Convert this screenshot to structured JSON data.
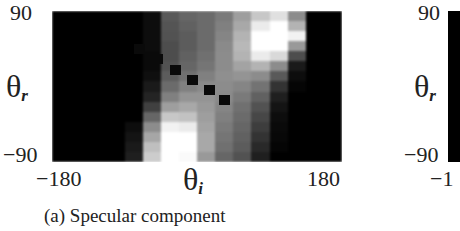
{
  "figure": {
    "caption": "(a)  Specular component",
    "panel_a": {
      "y_tick_top": "90",
      "y_tick_bottom": "−90",
      "x_tick_left": "−180",
      "x_tick_right": "180",
      "y_label_symbol": "θ",
      "y_label_sub": "r",
      "x_label_symbol": "θ",
      "x_label_sub": "i"
    },
    "panel_b": {
      "y_tick_top": "90",
      "y_tick_bottom": "−90",
      "x_tick_left": "−1",
      "y_label_symbol": "θ",
      "y_label_sub": "r"
    }
  },
  "chart_data": {
    "type": "heatmap",
    "title": "(a) Specular component",
    "xlabel": "θ_i",
    "ylabel": "θ_r",
    "xlim": [
      -180,
      180
    ],
    "ylim": [
      -90,
      90
    ],
    "x_ticks": [
      "-180",
      "180"
    ],
    "y_ticks": [
      "-90",
      "90"
    ],
    "colormap": "grayscale (black = 0, white = 1)",
    "grid_cols": 16,
    "grid_rows": 15,
    "values": [
      [
        0,
        0,
        0,
        0,
        0,
        0.05,
        0.35,
        0.4,
        0.42,
        0.48,
        0.62,
        0.78,
        0.88,
        0.55,
        0,
        0
      ],
      [
        0,
        0,
        0,
        0,
        0,
        0.05,
        0.33,
        0.38,
        0.42,
        0.5,
        0.66,
        0.92,
        1.0,
        0.7,
        0,
        0
      ],
      [
        0,
        0,
        0,
        0,
        0,
        0.05,
        0.32,
        0.36,
        0.42,
        0.52,
        0.7,
        1.0,
        1.0,
        0.95,
        0,
        0
      ],
      [
        0,
        0,
        0,
        0,
        0,
        0.05,
        0.3,
        0.36,
        0.42,
        0.54,
        0.72,
        1.0,
        1.0,
        0.6,
        0,
        0
      ],
      [
        0,
        0,
        0,
        0,
        0,
        0.04,
        0.3,
        0.38,
        0.44,
        0.55,
        0.7,
        0.92,
        0.85,
        0.3,
        0,
        0
      ],
      [
        0,
        0,
        0,
        0,
        0,
        0.04,
        0.32,
        0.4,
        0.46,
        0.55,
        0.64,
        0.7,
        0.55,
        0.1,
        0,
        0
      ],
      [
        0,
        0,
        0,
        0,
        0,
        0.06,
        0.36,
        0.44,
        0.5,
        0.56,
        0.58,
        0.55,
        0.35,
        0.05,
        0,
        0
      ],
      [
        0,
        0,
        0,
        0,
        0,
        0.1,
        0.42,
        0.5,
        0.54,
        0.55,
        0.52,
        0.45,
        0.2,
        0.02,
        0,
        0
      ],
      [
        0,
        0,
        0,
        0,
        0,
        0.14,
        0.5,
        0.58,
        0.58,
        0.54,
        0.48,
        0.38,
        0.12,
        0,
        0,
        0
      ],
      [
        0,
        0,
        0,
        0,
        0,
        0.25,
        0.62,
        0.66,
        0.6,
        0.52,
        0.44,
        0.32,
        0.08,
        0,
        0,
        0
      ],
      [
        0,
        0,
        0,
        0,
        0,
        0.4,
        0.78,
        0.76,
        0.62,
        0.5,
        0.42,
        0.28,
        0.05,
        0,
        0,
        0
      ],
      [
        0,
        0,
        0,
        0,
        0.05,
        0.55,
        0.95,
        0.92,
        0.64,
        0.48,
        0.4,
        0.24,
        0.04,
        0,
        0,
        0
      ],
      [
        0,
        0,
        0,
        0,
        0.08,
        0.65,
        1.0,
        1.0,
        0.66,
        0.46,
        0.38,
        0.2,
        0.03,
        0,
        0,
        0
      ],
      [
        0,
        0,
        0,
        0,
        0.1,
        0.75,
        1.0,
        1.0,
        0.66,
        0.44,
        0.36,
        0.16,
        0.02,
        0,
        0,
        0
      ],
      [
        0,
        0,
        0,
        0,
        0.12,
        0.8,
        1.0,
        0.98,
        0.6,
        0.4,
        0.32,
        0.12,
        0,
        0,
        0,
        0
      ]
    ],
    "markers": {
      "description": "dark square markers along a diagonal (specular direction)",
      "points": [
        [
          -72,
          45
        ],
        [
          -50,
          33
        ],
        [
          -27,
          20
        ],
        [
          -6,
          8
        ],
        [
          15,
          -4
        ],
        [
          33,
          -16
        ]
      ]
    },
    "second_panel_partial": {
      "ylabel": "θ_r",
      "y_ticks": [
        "-90",
        "90"
      ],
      "x_tick_left_partial": "-1"
    }
  }
}
